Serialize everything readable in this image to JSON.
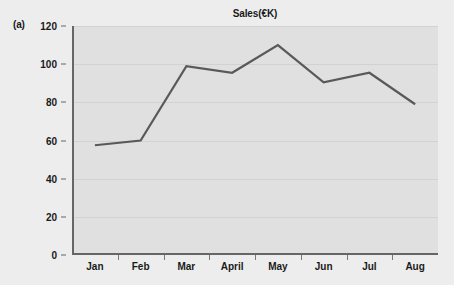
{
  "panel": {
    "label": "(a)"
  },
  "chart_data": {
    "type": "line",
    "title": "Sales(€K)",
    "xlabel": "",
    "ylabel": "",
    "categories": [
      "Jan",
      "Feb",
      "Mar",
      "April",
      "May",
      "Jun",
      "Jul",
      "Aug"
    ],
    "values": [
      57.5,
      60,
      99,
      95.5,
      110,
      90.5,
      95.5,
      79
    ],
    "series": [
      {
        "name": "Sales",
        "values": [
          57.5,
          60,
          99,
          95.5,
          110,
          90.5,
          95.5,
          79
        ]
      }
    ],
    "ylim": [
      0,
      120
    ],
    "yticks": [
      0,
      20,
      40,
      60,
      80,
      100,
      120
    ],
    "ytick_labels": [
      "0",
      "20",
      "40",
      "60",
      "80",
      "100",
      "120"
    ],
    "grid": true,
    "grid_axis": "y",
    "legend": false,
    "legend_position": "none",
    "colors": {
      "line": "#595959",
      "plot_background": "#e0e0e0",
      "figure_background": "#ededed",
      "gridline": "#d2d2d2",
      "axis": "#666666",
      "text": "#1a1a1a"
    }
  }
}
